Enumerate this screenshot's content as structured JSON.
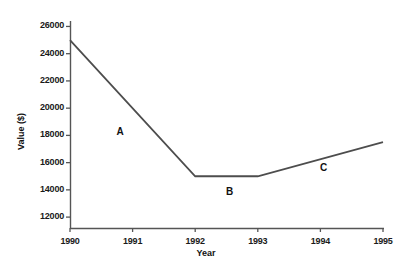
{
  "chart_data": {
    "type": "line",
    "title": "",
    "xlabel": "Year",
    "ylabel": "Value ($)",
    "x": [
      1990,
      1991,
      1992,
      1993,
      1994,
      1995
    ],
    "categories": [
      "1990",
      "1991",
      "1992",
      "1993",
      "1994",
      "1995"
    ],
    "series": [
      {
        "name": "Value",
        "points": [
          {
            "x": 1990,
            "y": 25000
          },
          {
            "x": 1992,
            "y": 15000
          },
          {
            "x": 1993,
            "y": 15000
          },
          {
            "x": 1995,
            "y": 17500
          }
        ],
        "color": "#4d4d4d"
      }
    ],
    "xlim": [
      1990,
      1995
    ],
    "ylim": [
      11200,
      26400
    ],
    "yticks": [
      12000,
      14000,
      16000,
      18000,
      20000,
      22000,
      24000,
      26000
    ],
    "ytick_labels": [
      "12000",
      "14000",
      "16000",
      "18000",
      "20000",
      "22000",
      "24000",
      "26000"
    ],
    "xticks": [
      1990,
      1991,
      1992,
      1993,
      1994,
      1995
    ],
    "xtick_labels": [
      "1990",
      "1991",
      "1992",
      "1993",
      "1994",
      "1995"
    ],
    "grid": false,
    "legend": "none",
    "annotations": [
      {
        "label": "A",
        "x": 1990.8,
        "y": 18150,
        "segment": "1990-1992 decline"
      },
      {
        "label": "B",
        "x": 1992.55,
        "y": 13800,
        "segment": "1992-1993 flat"
      },
      {
        "label": "C",
        "x": 1994.05,
        "y": 15500,
        "segment": "1993-1995 rise"
      }
    ]
  },
  "axes": {
    "y_title": "Value ($)",
    "x_title": "Year"
  }
}
